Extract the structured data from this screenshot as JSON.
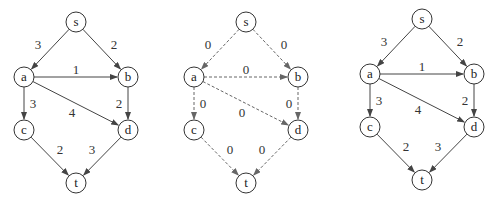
{
  "graphs": [
    {
      "name": "original",
      "style": "solid",
      "nodes": [
        "s",
        "a",
        "b",
        "c",
        "d",
        "t"
      ],
      "edges": [
        {
          "from": "s",
          "to": "a",
          "weight": "3"
        },
        {
          "from": "s",
          "to": "b",
          "weight": "2"
        },
        {
          "from": "a",
          "to": "b",
          "weight": "1"
        },
        {
          "from": "a",
          "to": "c",
          "weight": "3"
        },
        {
          "from": "a",
          "to": "d",
          "weight": "4"
        },
        {
          "from": "b",
          "to": "d",
          "weight": "2"
        },
        {
          "from": "c",
          "to": "t",
          "weight": "2"
        },
        {
          "from": "d",
          "to": "t",
          "weight": "3"
        }
      ]
    },
    {
      "name": "zero-weight",
      "style": "dashed",
      "nodes": [
        "s",
        "a",
        "b",
        "c",
        "d",
        "t"
      ],
      "edges": [
        {
          "from": "s",
          "to": "a",
          "weight": "0"
        },
        {
          "from": "s",
          "to": "b",
          "weight": "0"
        },
        {
          "from": "a",
          "to": "b",
          "weight": "0"
        },
        {
          "from": "a",
          "to": "c",
          "weight": "0"
        },
        {
          "from": "a",
          "to": "d",
          "weight": "0"
        },
        {
          "from": "b",
          "to": "d",
          "weight": "0"
        },
        {
          "from": "c",
          "to": "t",
          "weight": "0"
        },
        {
          "from": "d",
          "to": "t",
          "weight": "0"
        }
      ]
    },
    {
      "name": "result",
      "style": "solid",
      "nodes": [
        "s",
        "a",
        "b",
        "c",
        "d",
        "t"
      ],
      "edges": [
        {
          "from": "s",
          "to": "a",
          "weight": "3"
        },
        {
          "from": "s",
          "to": "b",
          "weight": "2"
        },
        {
          "from": "a",
          "to": "b",
          "weight": "1"
        },
        {
          "from": "a",
          "to": "c",
          "weight": "3"
        },
        {
          "from": "a",
          "to": "d",
          "weight": "4"
        },
        {
          "from": "b",
          "to": "d",
          "weight": "2"
        },
        {
          "from": "c",
          "to": "t",
          "weight": "2"
        },
        {
          "from": "d",
          "to": "t",
          "weight": "3"
        }
      ]
    }
  ]
}
